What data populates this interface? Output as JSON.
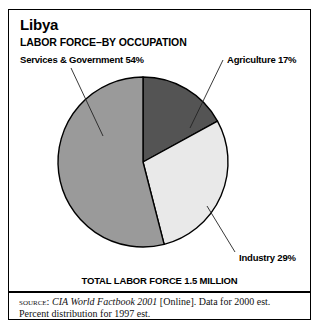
{
  "figure": {
    "country": "Libya",
    "subtitle": "LABOR FORCE–BY OCCUPATION",
    "total_line": "TOTAL LABOR FORCE 1.5 MILLION"
  },
  "labels": {
    "services": "Services & Government 54%",
    "agriculture": "Agriculture 17%",
    "industry": "Industry 29%"
  },
  "source": {
    "kicker": "SOURCE:",
    "work_italic": "CIA World Factbook 2001",
    "rest": "[Online]. Data for 2000 est.",
    "line2": "Percent distribution for 1997 est."
  },
  "colors": {
    "agriculture": "#545454",
    "industry": "#e9e9e9",
    "services": "#9a9a9a",
    "outline": "#000000",
    "background": "#ffffff"
  },
  "chart_data": {
    "type": "pie",
    "title": "Libya",
    "subtitle": "LABOR FORCE–BY OCCUPATION",
    "categories": [
      "Agriculture",
      "Industry",
      "Services & Government"
    ],
    "values": [
      17,
      29,
      54
    ],
    "value_unit": "percent",
    "labels": [
      "Agriculture 17%",
      "Industry 29%",
      "Services & Government 54%"
    ],
    "colors": [
      "#545454",
      "#e9e9e9",
      "#9a9a9a"
    ],
    "start_angle_deg": 0,
    "direction": "clockwise",
    "annotation": "TOTAL LABOR FORCE 1.5 MILLION",
    "total_labor_force": "1.5 million",
    "legend": "callout-labels-with-leader-lines",
    "grid": false,
    "xlabel": "",
    "ylabel": ""
  }
}
